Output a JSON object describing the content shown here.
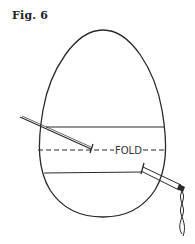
{
  "figure": {
    "title": "Fig. 6",
    "fold_label": "FOLD"
  },
  "colors": {
    "stroke": "#2a2a2a",
    "background": "#ffffff"
  },
  "diagram": {
    "shape": "egg",
    "elements": [
      "egg-outline",
      "upper-stitch-line",
      "fold-dashed-line",
      "lower-stitch-line",
      "left-needle",
      "right-needle-with-thread"
    ]
  }
}
